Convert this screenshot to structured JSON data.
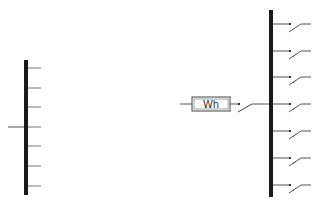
{
  "diagram": {
    "type": "single-line electrical schematic",
    "colors": {
      "bus": "#1a1a1a",
      "line": "#555555",
      "background": "#ffffff"
    },
    "left_bus": {
      "feeders": 7,
      "incoming_feed_position": 4
    },
    "meter": {
      "label": "Wh"
    },
    "right_bus": {
      "outgoing_breakers": 7
    }
  }
}
